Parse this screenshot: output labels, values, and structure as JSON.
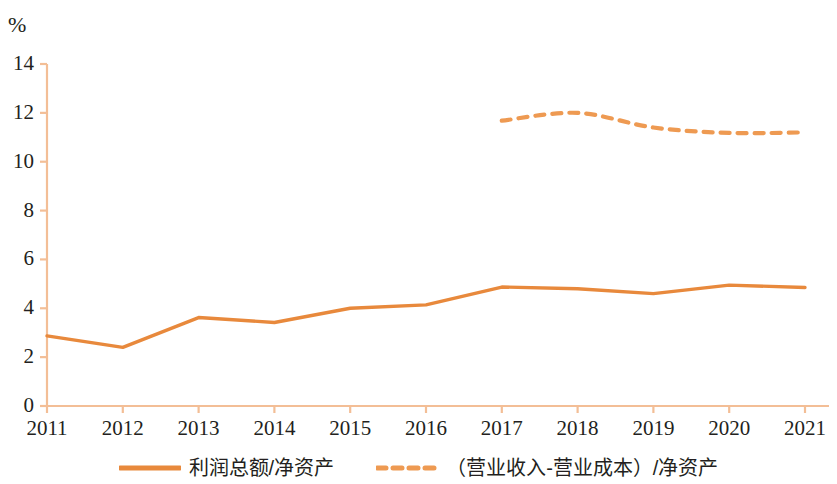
{
  "chart_data": {
    "type": "line",
    "title": "",
    "subtitle": "",
    "xlabel": "",
    "ylabel": "",
    "unit_label": "%",
    "categories": [
      "2011",
      "2012",
      "2013",
      "2014",
      "2015",
      "2016",
      "2017",
      "2018",
      "2019",
      "2020",
      "2021"
    ],
    "ylim": [
      0,
      14
    ],
    "y_ticks": [
      "0",
      "2",
      "4",
      "6",
      "8",
      "10",
      "12",
      "14"
    ],
    "y_tick_values": [
      0,
      2,
      4,
      6,
      8,
      10,
      12,
      14
    ],
    "grid": false,
    "legend_position": "bottom",
    "series": [
      {
        "name": "利润总额/净资产",
        "style": "solid",
        "color": "#E8893C",
        "values": [
          2.87,
          2.4,
          3.62,
          3.42,
          4.0,
          4.14,
          4.87,
          4.8,
          4.6,
          4.95,
          4.85
        ]
      },
      {
        "name": "（营业收入-营业成本）/净资产",
        "style": "dashed",
        "color": "#EE9A52",
        "values": [
          null,
          null,
          null,
          null,
          null,
          null,
          11.68,
          12.0,
          11.4,
          11.18,
          11.2
        ]
      }
    ]
  },
  "axis": {
    "line_color": "#F3BE96",
    "tick_color": "#F3BE96",
    "text_color": "#231f20"
  },
  "legend": {
    "items": [
      {
        "label": "利润总额/净资产",
        "marker": "solid-line-swatch",
        "color": "#E8893C"
      },
      {
        "label": "（营业收入-营业成本）/净资产",
        "marker": "dashed-line-swatch",
        "color": "#EE9A52"
      }
    ]
  }
}
